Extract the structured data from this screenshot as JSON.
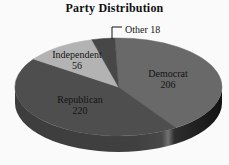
{
  "chart_data": {
    "type": "pie",
    "title": "Party Distribution",
    "total": 500,
    "start_angle_deg": 92,
    "direction": "clockwise",
    "style_3d": true,
    "label_color": "#141414",
    "background": "#fafafa",
    "categories": [
      "Democrat",
      "Republican",
      "Independent",
      "Other"
    ],
    "values": [
      206,
      220,
      56,
      18
    ],
    "slices": [
      {
        "label": "Democrat",
        "value": 206,
        "color": "#696969",
        "label_pos": {
          "x": 168,
          "y": 77
        }
      },
      {
        "label": "Republican",
        "value": 220,
        "color": "#4e4e4e",
        "label_pos": {
          "x": 80,
          "y": 103
        }
      },
      {
        "label": "Independent",
        "value": 56,
        "color": "#b3b3b3",
        "label_pos": {
          "x": 77,
          "y": 58
        }
      },
      {
        "label": "Other",
        "value": 18,
        "color": "#474747",
        "label_pos": {
          "x": 125,
          "y": 33
        },
        "leader_line": true
      }
    ],
    "side_colors": {
      "left": "#3d3d3d",
      "band": "#717171",
      "right": "#121212"
    }
  }
}
